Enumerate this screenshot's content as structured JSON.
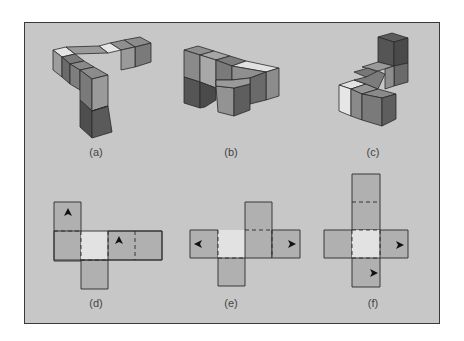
{
  "figure": {
    "background": "#c7c7c7",
    "panels": [
      {
        "id": "a",
        "label": "(a)",
        "kind": "cube-assembly"
      },
      {
        "id": "b",
        "label": "(b)",
        "kind": "cube-assembly"
      },
      {
        "id": "c",
        "label": "(c)",
        "kind": "cube-assembly"
      },
      {
        "id": "d",
        "label": "(d)",
        "kind": "cube-net",
        "arrows": [
          "up",
          "up"
        ]
      },
      {
        "id": "e",
        "label": "(e)",
        "kind": "cube-net",
        "arrows": [
          "left",
          "right"
        ]
      },
      {
        "id": "f",
        "label": "(f)",
        "kind": "cube-net",
        "arrows": [
          "right",
          "right"
        ]
      }
    ],
    "colors": {
      "light": "#e6e6e6",
      "mid": "#9a9a9a",
      "midlight": "#adadad",
      "dark": "#6e6e6e",
      "darker": "#555555",
      "net_face": "#b0b0b0",
      "net_highlight": "#e2e2e2",
      "edge": "#2a2a2a"
    }
  }
}
